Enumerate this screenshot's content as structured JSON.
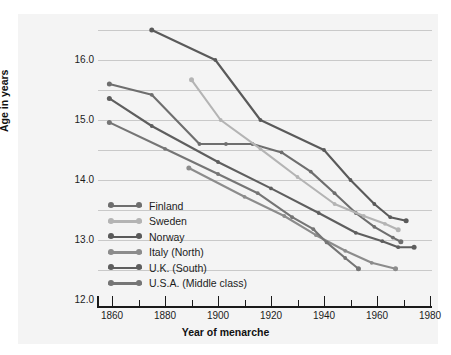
{
  "chart_data": {
    "type": "line",
    "title": "",
    "xlabel": "Year of menarche",
    "ylabel": "Age in years",
    "xlim": [
      1852,
      1980
    ],
    "ylim": [
      12.0,
      16.55
    ],
    "grid": true,
    "grid_interval": 0.5,
    "legend_position": "inside-lower-left",
    "xticks": [
      1860,
      1880,
      1900,
      1920,
      1940,
      1960,
      1980
    ],
    "xtick_labels": [
      "1860",
      "1880",
      "1900",
      "1920",
      "1940",
      "1960",
      "1980"
    ],
    "xminor_ticks": [
      1870,
      1890,
      1910,
      1930,
      1950,
      1970
    ],
    "yticks": [
      12.0,
      13.0,
      14.0,
      15.0,
      16.0
    ],
    "ytick_labels": [
      "12.0",
      "13.0",
      "14.0",
      "15.0",
      "16.0"
    ],
    "ygridlines": [
      12.5,
      13.0,
      13.5,
      14.0,
      14.5,
      15.0,
      15.5,
      16.0,
      16.5
    ],
    "series": [
      {
        "name": "Finland",
        "color": "#6e6e6e",
        "points": [
          {
            "x": 1859,
            "y": 15.6
          },
          {
            "x": 1875,
            "y": 15.42
          },
          {
            "x": 1893,
            "y": 14.6
          },
          {
            "x": 1903,
            "y": 14.6
          },
          {
            "x": 1913,
            "y": 14.6
          },
          {
            "x": 1924,
            "y": 14.46
          },
          {
            "x": 1935,
            "y": 14.14
          },
          {
            "x": 1944,
            "y": 13.78
          },
          {
            "x": 1952,
            "y": 13.45
          },
          {
            "x": 1959,
            "y": 13.22
          },
          {
            "x": 1966,
            "y": 13.04
          },
          {
            "x": 1969,
            "y": 12.97
          }
        ]
      },
      {
        "name": "Sweden",
        "color": "#b4b4b4",
        "points": [
          {
            "x": 1890,
            "y": 15.67
          },
          {
            "x": 1901,
            "y": 15.0
          },
          {
            "x": 1916,
            "y": 14.52
          },
          {
            "x": 1930,
            "y": 14.05
          },
          {
            "x": 1944,
            "y": 13.6
          },
          {
            "x": 1955,
            "y": 13.4
          },
          {
            "x": 1963,
            "y": 13.27
          },
          {
            "x": 1968,
            "y": 13.17
          }
        ]
      },
      {
        "name": "Norway",
        "color": "#5a5a5a",
        "points": [
          {
            "x": 1875,
            "y": 16.5
          },
          {
            "x": 1899,
            "y": 16.0
          },
          {
            "x": 1916,
            "y": 15.0
          },
          {
            "x": 1940,
            "y": 14.5
          },
          {
            "x": 1950,
            "y": 14.0
          },
          {
            "x": 1959,
            "y": 13.6
          },
          {
            "x": 1965,
            "y": 13.38
          },
          {
            "x": 1971,
            "y": 13.32
          }
        ]
      },
      {
        "name": "Italy (North)",
        "color": "#8c8c8c",
        "points": [
          {
            "x": 1889,
            "y": 14.2
          },
          {
            "x": 1910,
            "y": 13.72
          },
          {
            "x": 1925,
            "y": 13.4
          },
          {
            "x": 1937,
            "y": 13.08
          },
          {
            "x": 1948,
            "y": 12.82
          },
          {
            "x": 1958,
            "y": 12.62
          },
          {
            "x": 1967,
            "y": 12.52
          }
        ]
      },
      {
        "name": "U.K. (South)",
        "color": "#5e5e5e",
        "points": [
          {
            "x": 1859,
            "y": 15.36
          },
          {
            "x": 1875,
            "y": 14.9
          },
          {
            "x": 1900,
            "y": 14.3
          },
          {
            "x": 1920,
            "y": 13.86
          },
          {
            "x": 1938,
            "y": 13.45
          },
          {
            "x": 1952,
            "y": 13.12
          },
          {
            "x": 1962,
            "y": 12.98
          },
          {
            "x": 1968,
            "y": 12.88
          },
          {
            "x": 1974,
            "y": 12.88
          }
        ]
      },
      {
        "name": "U.S.A. (Middle class)",
        "color": "#757575",
        "points": [
          {
            "x": 1859,
            "y": 14.96
          },
          {
            "x": 1880,
            "y": 14.52
          },
          {
            "x": 1900,
            "y": 14.1
          },
          {
            "x": 1915,
            "y": 13.78
          },
          {
            "x": 1928,
            "y": 13.38
          },
          {
            "x": 1936,
            "y": 13.18
          },
          {
            "x": 1941,
            "y": 12.96
          },
          {
            "x": 1948,
            "y": 12.7
          },
          {
            "x": 1953,
            "y": 12.52
          }
        ]
      }
    ]
  }
}
